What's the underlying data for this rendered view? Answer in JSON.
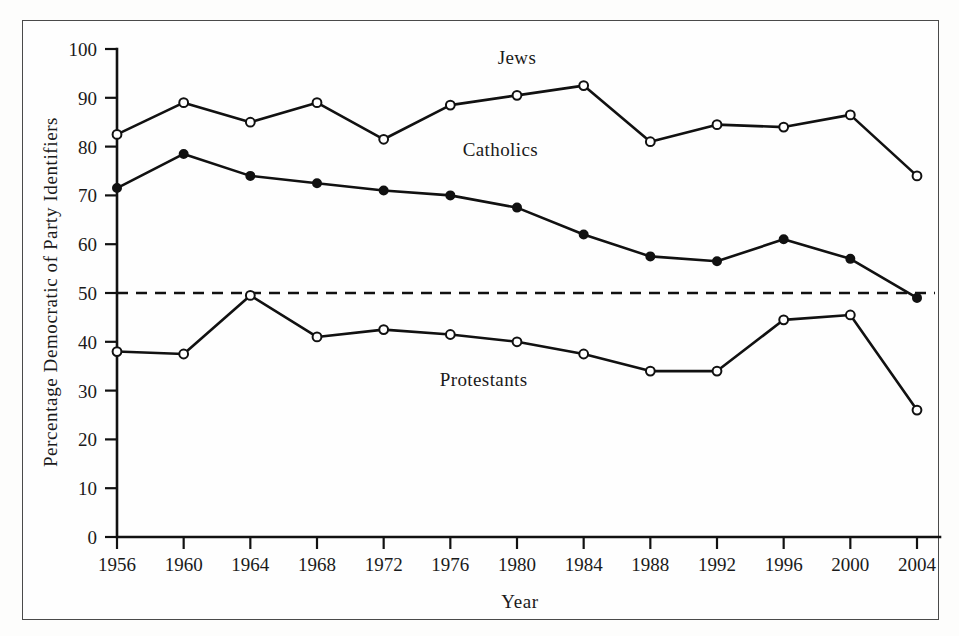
{
  "chart_data": {
    "type": "line",
    "title": "",
    "subtitle": "",
    "xlabel": "Year",
    "ylabel": "Percentage Democratic of Party Identifiers",
    "x": [
      1956,
      1960,
      1964,
      1968,
      1972,
      1976,
      1980,
      1984,
      1988,
      1992,
      1996,
      2000,
      2004
    ],
    "xtick_labels": [
      "1956",
      "1960",
      "1964",
      "1968",
      "1972",
      "1976",
      "1980",
      "1984",
      "1988",
      "1992",
      "1996",
      "2000",
      "2004"
    ],
    "ytick_labels": [
      "0",
      "10",
      "20",
      "30",
      "40",
      "50",
      "60",
      "70",
      "80",
      "90",
      "100"
    ],
    "ytick_values": [
      0,
      10,
      20,
      30,
      40,
      50,
      60,
      70,
      80,
      90,
      100
    ],
    "ylim": [
      0,
      100
    ],
    "xlim": [
      1956,
      2004
    ],
    "grid": false,
    "legend": "inline-labels",
    "reference_line": {
      "value": 50,
      "style": "dashed",
      "label": ""
    },
    "series": [
      {
        "name": "Jews",
        "marker": "open-circle",
        "label_x": 1980,
        "label_y": 97,
        "values": [
          82.5,
          89.0,
          85.0,
          89.0,
          81.5,
          88.5,
          90.5,
          92.5,
          81.0,
          84.5,
          84.0,
          86.5,
          74.0
        ]
      },
      {
        "name": "Catholics",
        "marker": "filled-circle",
        "label_x": 1979,
        "label_y": 78,
        "values": [
          71.5,
          78.5,
          74.0,
          72.5,
          71.0,
          70.0,
          67.5,
          62.0,
          57.5,
          56.5,
          61.0,
          57.0,
          49.0
        ]
      },
      {
        "name": "Protestants",
        "marker": "open-circle",
        "label_x": 1978,
        "label_y": 31,
        "values": [
          38.0,
          37.5,
          49.5,
          41.0,
          42.5,
          41.5,
          40.0,
          37.5,
          34.0,
          34.0,
          44.5,
          45.5,
          26.0
        ]
      }
    ]
  },
  "colors": {
    "ink": "#111111",
    "frame": "#4a4a4a",
    "background": "#fefefe",
    "marker_fill_open": "#ffffff",
    "marker_fill_solid": "#111111"
  }
}
